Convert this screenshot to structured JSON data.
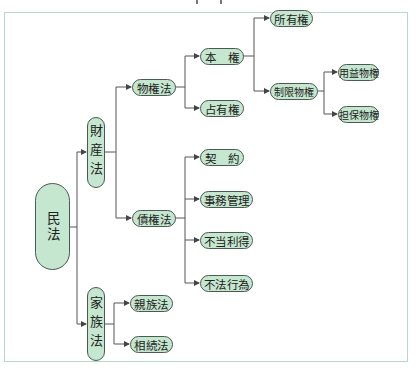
{
  "diagram": {
    "type": "tree",
    "colors": {
      "node_fill": "#c5e6cf",
      "node_border": "#4a5a50",
      "line": "#555555",
      "frame_border": "#b8d8c8"
    },
    "root": {
      "label": "民法"
    },
    "nodes": {
      "zaisanhou": "財産法",
      "kazokuhou": "家族法",
      "bukkenhou": "物権法",
      "saikenhou": "債権法",
      "honken": "本　権",
      "senyuuken": "占有権",
      "shoyuuken": "所有権",
      "seigenbukken": "制限物権",
      "youekibukken": "用益物権",
      "tanpobukken": "担保物権",
      "keiyaku": "契　約",
      "jimukanri": "事務管理",
      "futouritoku": "不当利得",
      "fuhoukoui": "不法行為",
      "shinzokuhou": "親族法",
      "souzokuhou": "相続法"
    },
    "edges": [
      [
        "民法",
        "財産法"
      ],
      [
        "民法",
        "家族法"
      ],
      [
        "財産法",
        "物権法"
      ],
      [
        "財産法",
        "債権法"
      ],
      [
        "物権法",
        "本権"
      ],
      [
        "物権法",
        "占有権"
      ],
      [
        "本権",
        "所有権"
      ],
      [
        "本権",
        "制限物権"
      ],
      [
        "制限物権",
        "用益物権"
      ],
      [
        "制限物権",
        "担保物権"
      ],
      [
        "債権法",
        "契約"
      ],
      [
        "債権法",
        "事務管理"
      ],
      [
        "債権法",
        "不当利得"
      ],
      [
        "債権法",
        "不法行為"
      ],
      [
        "家族法",
        "親族法"
      ],
      [
        "家族法",
        "相続法"
      ]
    ]
  }
}
